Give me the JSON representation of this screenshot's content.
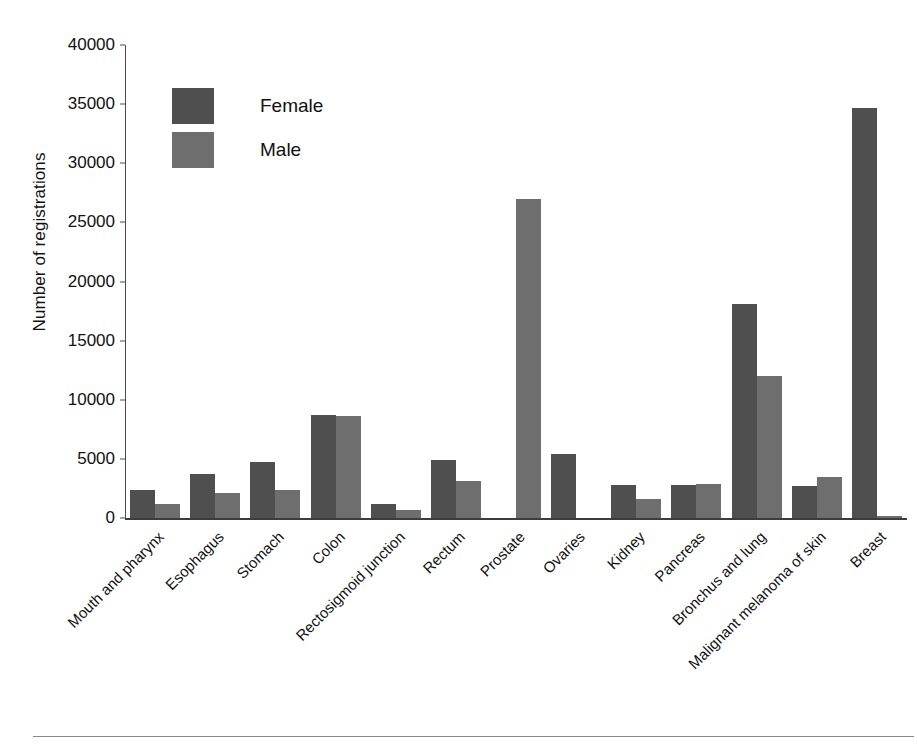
{
  "chart_data": {
    "type": "bar",
    "title": "",
    "subtitle": "",
    "xlabel": "",
    "ylabel": "Number of registrations",
    "ylim": [
      0,
      40000
    ],
    "yticks": [
      0,
      5000,
      10000,
      15000,
      20000,
      25000,
      30000,
      35000,
      40000
    ],
    "ytick_labels": [
      "0",
      "5000",
      "10000",
      "15000",
      "20000",
      "25000",
      "30000",
      "35000",
      "40000"
    ],
    "grid": false,
    "legend_position": "upper-left",
    "orientation": "vertical",
    "categories": [
      "Mouth and pharynx",
      "Esophagus",
      "Stomach",
      "Colon",
      "Rectosigmoid junction",
      "Rectum",
      "Prostate",
      "Ovaries",
      "Kidney",
      "Pancreas",
      "Bronchus and lung",
      "Malignant melanoma of skin",
      "Breast"
    ],
    "series": [
      {
        "name": "Female",
        "color": "#4f4f4f",
        "values": [
          2400,
          3700,
          4700,
          8700,
          1200,
          4900,
          0,
          5400,
          2800,
          2800,
          18100,
          2700,
          34700
        ]
      },
      {
        "name": "Male",
        "color": "#6e6e6e",
        "values": [
          1200,
          2100,
          2400,
          8600,
          700,
          3100,
          27000,
          0,
          1600,
          2900,
          12000,
          3500,
          200
        ]
      }
    ]
  },
  "legend": {
    "items": [
      {
        "label": "Female",
        "color": "#4f4f4f"
      },
      {
        "label": "Male",
        "color": "#6e6e6e"
      }
    ]
  },
  "axes": {
    "y_title": "Number of registrations"
  }
}
